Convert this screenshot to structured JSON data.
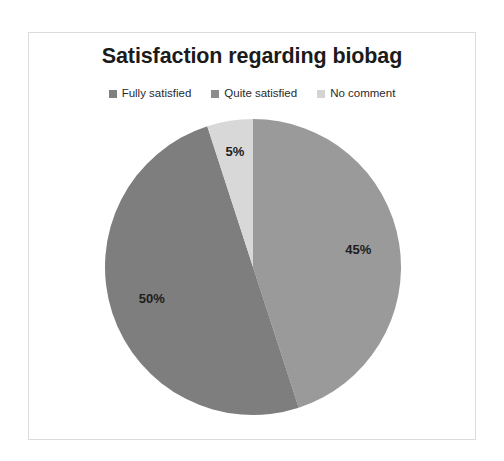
{
  "chart": {
    "title": "Satisfaction regarding biobag",
    "frame_border_color": "#dcdcdc",
    "background": "#ffffff"
  },
  "legend": {
    "position": "top",
    "items": [
      {
        "label": "Fully satisfied",
        "color": "#808080",
        "marker": "square-marker"
      },
      {
        "label": "Quite satisfied",
        "color": "#8c8c8c",
        "marker": "square-marker"
      },
      {
        "label": "No comment",
        "color": "#d4d4d4",
        "marker": "square-marker"
      }
    ]
  },
  "chart_data": {
    "type": "pie",
    "title": "Satisfaction regarding biobag",
    "xlabel": "",
    "ylabel": "",
    "legend_position": "top",
    "start_angle_deg": 0,
    "direction": "clockwise",
    "categories": [
      "Fully satisfied",
      "Quite satisfied",
      "No comment"
    ],
    "values": [
      45,
      50,
      5
    ],
    "value_unit": "%",
    "data_labels": [
      "45%",
      "50%",
      "5%"
    ],
    "colors": [
      "#9a9a9a",
      "#7e7e7e",
      "#d8d8d8"
    ],
    "slices": [
      {
        "name": "Fully satisfied",
        "value": 45,
        "label": "45%",
        "color": "#9a9a9a"
      },
      {
        "name": "Quite satisfied",
        "value": 50,
        "label": "50%",
        "color": "#7e7e7e"
      },
      {
        "name": "No comment",
        "value": 5,
        "label": "5%",
        "color": "#d8d8d8"
      }
    ]
  }
}
